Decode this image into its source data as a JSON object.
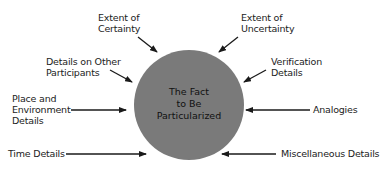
{
  "diagram": {
    "center": {
      "lines": [
        "The Fact",
        "to Be",
        "Particularized"
      ],
      "fill": "#7a7a7a"
    },
    "colors": {
      "arrow": "#1a1a1a",
      "text": "#222222",
      "background": "#ffffff"
    },
    "labels": {
      "extent_certainty": [
        "Extent of",
        "Certainty"
      ],
      "extent_uncertainty": [
        "Extent of",
        "Uncertainty"
      ],
      "other_participants": [
        "Details on Other",
        "Participants"
      ],
      "verification": [
        "Verification",
        "Details"
      ],
      "place_environment": [
        "Place and",
        "Environment",
        "Details"
      ],
      "analogies": [
        "Analogies"
      ],
      "time": [
        "Time Details"
      ],
      "miscellaneous": [
        "Miscellaneous Details"
      ]
    }
  }
}
